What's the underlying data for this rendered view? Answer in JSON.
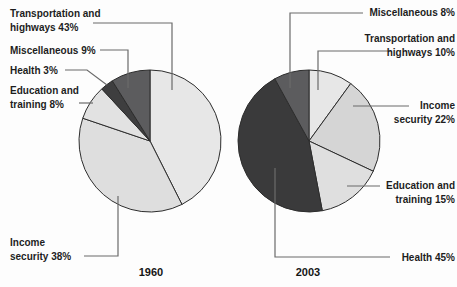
{
  "figure": {
    "description_values_unit": "%",
    "outline_color": "#2d2d2d",
    "leader_line_color": "#6b6b6b",
    "background_color": "#fdfdfd"
  },
  "chart_data": [
    {
      "type": "pie",
      "title": "1960",
      "unit": "percent",
      "legend_position": "outside-left",
      "slices": [
        {
          "name": "Transportation and highways",
          "value": 43,
          "label": "Transportation and\nhighways 43%",
          "fill": "#e7e7e7"
        },
        {
          "name": "Income security",
          "value": 38,
          "label": "Income\nsecurity 38%",
          "fill": "#dedede"
        },
        {
          "name": "Education and training",
          "value": 8,
          "label": "Education and\ntraining 8%",
          "fill": "#e2e2e2"
        },
        {
          "name": "Health",
          "value": 3,
          "label": "Health 3%",
          "fill": "#3e3e3f"
        },
        {
          "name": "Miscellaneous",
          "value": 9,
          "label": "Miscellaneous 9%",
          "fill": "#5c5c5e"
        }
      ]
    },
    {
      "type": "pie",
      "title": "2003",
      "unit": "percent",
      "legend_position": "outside-right",
      "slices": [
        {
          "name": "Transportation and highways",
          "value": 10,
          "label": "Transportation and\nhighways 10%",
          "fill": "#e7e7e7"
        },
        {
          "name": "Income security",
          "value": 22,
          "label": "Income\nsecurity 22%",
          "fill": "#d5d5d5"
        },
        {
          "name": "Education and training",
          "value": 15,
          "label": "Education and\ntraining 15%",
          "fill": "#dfdfdf"
        },
        {
          "name": "Health",
          "value": 45,
          "label": "Health 45%",
          "fill": "#3a3a3b"
        },
        {
          "name": "Miscellaneous",
          "value": 8,
          "label": "Miscellaneous 8%",
          "fill": "#5c5c5e"
        }
      ]
    }
  ]
}
